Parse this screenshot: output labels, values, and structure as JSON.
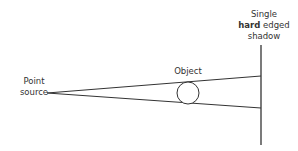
{
  "diagram": {
    "labels": {
      "source_line1": "Point",
      "source_line2": "source",
      "object": "Object",
      "shadow_line1": "Single",
      "shadow_bold": "hard",
      "shadow_rest": " edged",
      "shadow_line3": "shadow"
    },
    "colors": {
      "line": "#333333",
      "background": "#ffffff"
    }
  }
}
